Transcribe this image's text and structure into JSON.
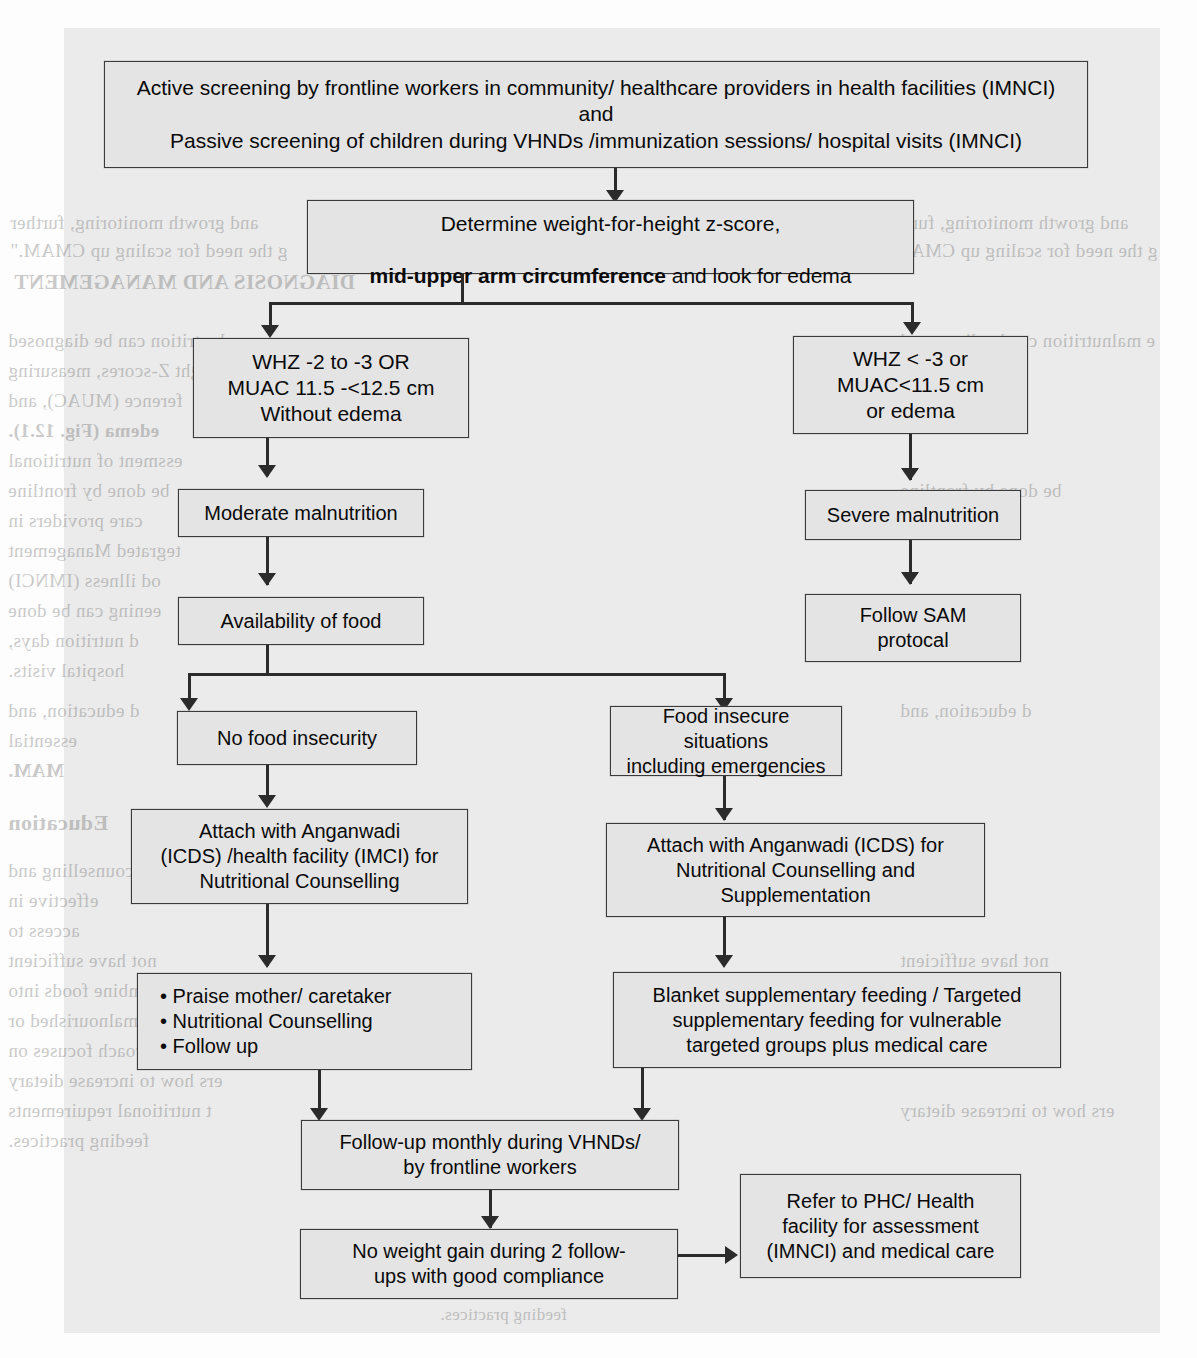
{
  "figure": {
    "type": "flowchart"
  },
  "nodes": {
    "screening": "Active screening by frontline workers in community/ healthcare providers in health facilities (IMNCI)\nand\nPassive screening of children during VHNDs /immunization sessions/ hospital visits (IMNCI)",
    "determine_line1": "Determine weight-for-height z-score,",
    "determine_bold": "mid-upper arm circumference",
    "determine_rest": " and  look for edema",
    "moderate_criteria": "WHZ -2 to -3 OR\nMUAC 11.5 -<12.5 cm\nWithout edema",
    "severe_criteria": "WHZ < -3 or\nMUAC<11.5 cm\nor  edema",
    "moderate_malnutrition": "Moderate malnutrition",
    "severe_malnutrition": "Severe malnutrition",
    "availability_of_food": "Availability of food",
    "follow_sam": "Follow SAM\nprotocal",
    "no_food_insecurity": "No food insecurity",
    "food_insecure": "Food insecure situations\nincluding emergencies",
    "attach_left": "Attach with Anganwadi\n(ICDS) /health facility (IMCI) for\nNutritional Counselling",
    "attach_right": "Attach with Anganwadi (ICDS) for\nNutritional Counselling and\nSupplementation",
    "bullets": "• Praise mother/ caretaker\n• Nutritional Counselling\n• Follow up",
    "blanket_feeding": "Blanket supplementary feeding / Targeted\nsupplementary feeding for vulnerable\ntargeted groups plus medical care",
    "follow_up_monthly": "Follow-up monthly during VHNDs/\nby frontline workers",
    "no_weight_gain": "No weight gain during 2 follow-\nups  with good compliance",
    "refer_phc": "Refer to  PHC/ Health\nfacility for assessment\n(IMNCI) and medical care"
  },
  "ghost_text": {
    "lines": [
      "and growth monitoring, further",
      "g the need for scaling up CMAM.\"",
      "DIAGNOSIS AND MANAGEMENT",
      "e malnutrition can be diagnosed",
      "ight Z-scores, measuring",
      "ference (MUAC), and",
      "edema (Fig. 12.1).",
      "essment of nutritional",
      "be done by frontline",
      "care providers in",
      "tegrated Management",
      "od illness (IMNCI)",
      "eening can be done",
      "d nutrition days,",
      "hospital visits.",
      "d education, and",
      "essential",
      "MAM.",
      "Education",
      "counselling and",
      "effective in",
      "access to",
      "not have sufficient",
      "to combine foods into",
      "feeding malnourished or",
      "This approach focuses on",
      "ers how to increase dietary",
      "t nutritional requirements",
      "feeding practices."
    ]
  }
}
